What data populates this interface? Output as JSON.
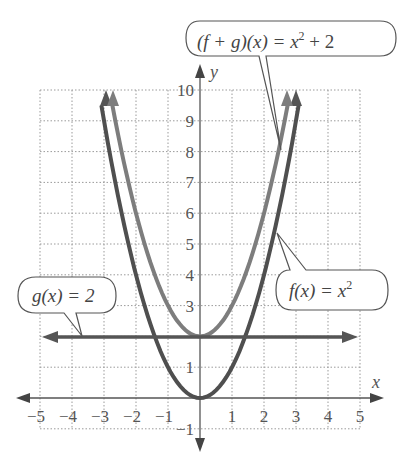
{
  "chart_data": {
    "type": "line",
    "title": "",
    "xlabel": "x",
    "ylabel": "y",
    "xlim": [
      -5,
      5
    ],
    "ylim": [
      -1,
      10
    ],
    "grid": true,
    "x_ticks": [
      "−5",
      "−4",
      "−3",
      "−2",
      "−1",
      "1",
      "2",
      "3",
      "4",
      "5"
    ],
    "y_ticks": [
      "−1",
      "1",
      "3",
      "4",
      "5",
      "6",
      "7",
      "8",
      "9",
      "10"
    ],
    "series": [
      {
        "name": "f(x) = x^2",
        "label_parts": [
          "f(x) = x",
          "2"
        ],
        "color": "#4a4a4a",
        "x": [
          -3.16,
          -3,
          -2,
          -1,
          0,
          1,
          2,
          3,
          3.16
        ],
        "y": [
          10,
          9,
          4,
          1,
          0,
          1,
          4,
          9,
          10
        ]
      },
      {
        "name": "g(x) = 2",
        "label_parts": [
          "g(x) = 2"
        ],
        "color": "#4a4a4a",
        "x": [
          -5,
          5
        ],
        "y": [
          2,
          2
        ]
      },
      {
        "name": "(f + g)(x) = x^2 + 2",
        "label_parts": [
          "(f + g)(x) = x",
          "2",
          " + 2"
        ],
        "color": "#7a7a7a",
        "x": [
          -2.83,
          -2,
          -1,
          0,
          1,
          2,
          2.83
        ],
        "y": [
          10,
          6,
          3,
          2,
          3,
          6,
          10
        ]
      }
    ]
  }
}
